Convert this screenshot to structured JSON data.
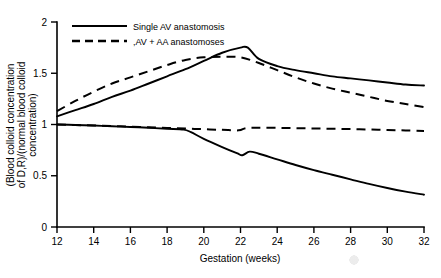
{
  "chart_data": {
    "type": "line",
    "title": "",
    "xlabel": "Gestation (weeks)",
    "ylabel": "(Blood colloid concentration of D,R)/(normal blood colloid concentration)",
    "xlim": [
      12,
      32
    ],
    "ylim": [
      0,
      2
    ],
    "xticks": [
      "12",
      "14",
      "16",
      "18",
      "20",
      "22",
      "24",
      "26",
      "28",
      "30",
      "32"
    ],
    "yticks": [
      "0",
      "0.5",
      "1",
      "1.5",
      "2"
    ],
    "grid": false,
    "legend_position": "top-left",
    "legend": [
      {
        "label": "Single AV anastomosis",
        "style": "solid"
      },
      {
        "label": ",AV + AA anastomoses",
        "style": "dashed"
      }
    ],
    "series": [
      {
        "name": "Recipient - Single AV anastomosis",
        "style": "solid",
        "x": [
          12,
          13,
          14,
          15,
          16,
          17,
          18,
          19,
          20,
          21,
          22,
          22.4,
          23,
          24,
          25,
          26,
          27,
          28,
          29,
          30,
          31,
          32
        ],
        "values": [
          1.08,
          1.14,
          1.2,
          1.27,
          1.33,
          1.4,
          1.47,
          1.54,
          1.62,
          1.7,
          1.75,
          1.75,
          1.64,
          1.57,
          1.53,
          1.5,
          1.47,
          1.45,
          1.43,
          1.41,
          1.39,
          1.38
        ]
      },
      {
        "name": "Recipient - AV + AA anastomoses",
        "style": "dashed",
        "x": [
          12,
          13,
          14,
          15,
          16,
          17,
          18,
          19,
          20,
          21,
          22,
          23,
          24,
          25,
          26,
          27,
          28,
          29,
          30,
          31,
          32
        ],
        "values": [
          1.13,
          1.23,
          1.32,
          1.4,
          1.46,
          1.52,
          1.58,
          1.63,
          1.655,
          1.66,
          1.655,
          1.6,
          1.53,
          1.46,
          1.4,
          1.35,
          1.31,
          1.27,
          1.23,
          1.2,
          1.17
        ]
      },
      {
        "name": "Donor - AV + AA anastomoses",
        "style": "dashed",
        "x": [
          12,
          13,
          14,
          15,
          16,
          17,
          18,
          19,
          20,
          21,
          21.9,
          22.3,
          23,
          24,
          25,
          26,
          27,
          28,
          29,
          30,
          31,
          32
        ],
        "values": [
          1.0,
          0.995,
          0.99,
          0.985,
          0.978,
          0.972,
          0.966,
          0.96,
          0.954,
          0.948,
          0.943,
          0.965,
          0.968,
          0.967,
          0.964,
          0.961,
          0.958,
          0.955,
          0.951,
          0.947,
          0.942,
          0.937
        ]
      },
      {
        "name": "Donor - Single AV anastomosis",
        "style": "solid",
        "x": [
          12,
          13,
          14,
          15,
          16,
          17,
          18,
          18.9,
          19.3,
          20,
          21,
          21.8,
          22.1,
          22.5,
          23,
          24,
          25,
          26,
          27,
          28,
          29,
          30,
          31,
          32
        ],
        "values": [
          1.0,
          0.995,
          0.99,
          0.983,
          0.976,
          0.968,
          0.958,
          0.95,
          0.925,
          0.86,
          0.78,
          0.72,
          0.7,
          0.735,
          0.715,
          0.66,
          0.605,
          0.555,
          0.51,
          0.465,
          0.42,
          0.38,
          0.345,
          0.315
        ]
      }
    ]
  }
}
